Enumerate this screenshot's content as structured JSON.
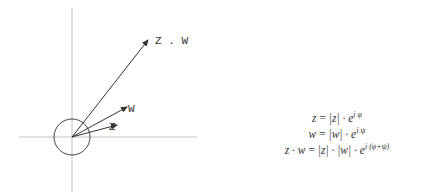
{
  "diagram": {
    "origin": {
      "x": 72,
      "y": 137
    },
    "axes": {
      "horizontal": {
        "x1": 19,
        "x2": 197,
        "y": 137
      },
      "vertical": {
        "x": 72,
        "y1": 8,
        "y2": 192
      }
    },
    "unit_circle": {
      "cx": 72,
      "cy": 137,
      "r": 18
    },
    "vectors": [
      {
        "name": "z",
        "label": "Z",
        "end": {
          "x": 117,
          "y": 125
        }
      },
      {
        "name": "w",
        "label": "W",
        "end": {
          "x": 127,
          "y": 107
        }
      },
      {
        "name": "z.w",
        "label": "Z . W",
        "end": {
          "x": 148,
          "y": 40
        }
      }
    ],
    "colors": {
      "axis": "#c0c0c0",
      "vector": "#333333",
      "circle": "#444444"
    }
  },
  "formulas": [
    {
      "lhs": "z",
      "rhs": "|z| · e",
      "exp": "i φ"
    },
    {
      "lhs": "w",
      "rhs": "|w| · e",
      "exp": "i ψ"
    },
    {
      "lhs": "z · w",
      "rhs": "|z| · |w| · e",
      "exp": "i (φ+ψ)"
    }
  ]
}
